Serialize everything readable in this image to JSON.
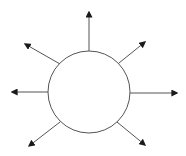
{
  "diagram": {
    "type": "radial-arrows",
    "background": "#ffffff",
    "stroke_color": "#555555",
    "arrowhead_color": "#1a1a1a",
    "stroke_width": 1,
    "circle": {
      "cx": 89,
      "cy": 92,
      "r": 41,
      "fill": "#ffffff"
    },
    "arrows": [
      {
        "name": "arrow-up",
        "x1": 89,
        "y1": 51,
        "x2": 89,
        "y2": 12
      },
      {
        "name": "arrow-upper-right",
        "x1": 119,
        "y1": 63,
        "x2": 145,
        "y2": 42
      },
      {
        "name": "arrow-right",
        "x1": 130,
        "y1": 93,
        "x2": 177,
        "y2": 93
      },
      {
        "name": "arrow-lower-right",
        "x1": 117,
        "y1": 122,
        "x2": 145,
        "y2": 145
      },
      {
        "name": "arrow-lower-left",
        "x1": 60,
        "y1": 122,
        "x2": 29,
        "y2": 146
      },
      {
        "name": "arrow-left",
        "x1": 48,
        "y1": 92,
        "x2": 12,
        "y2": 92
      },
      {
        "name": "arrow-upper-left",
        "x1": 60,
        "y1": 64,
        "x2": 25,
        "y2": 44
      }
    ]
  }
}
